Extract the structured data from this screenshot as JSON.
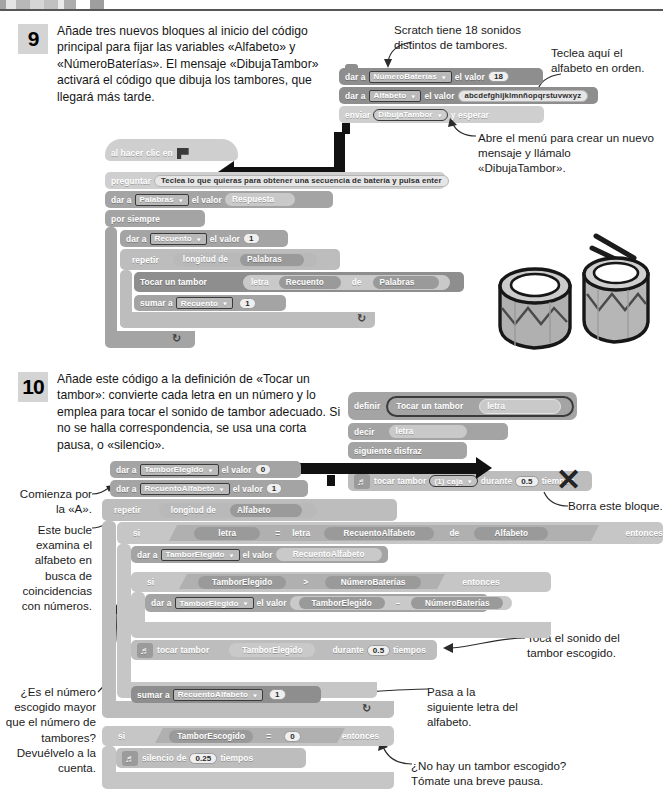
{
  "page": {
    "background": "#ffffff",
    "block_colors": {
      "dark_gray": "#8e8e8e",
      "mid_gray": "#a4a4a4",
      "light_gray": "#bdbdbd",
      "pale_gray": "#cfcfcf",
      "arrow_black": "#111111"
    }
  },
  "step9": {
    "number": "9",
    "text": "Añade tres nuevos bloques al inicio del código principal para fijar las variables «Alfabeto» y «NúmeroBaterías». El mensaje «DibujaTambor» activará el código que dibuja los tambores, que llegará más tarde.",
    "annotations": {
      "scratch_sounds": "Scratch tiene 18 sonidos distintos de tambores.",
      "type_alphabet": "Teclea aquí el alfabeto en orden.",
      "open_menu": "Abre el menú para crear un nuevo mensaje y llámalo «DibujaTambor»."
    },
    "new_blocks": [
      {
        "label": "dar a",
        "variable": "NúmeroBaterías",
        "value_label": "el valor",
        "value": "18"
      },
      {
        "label": "dar a",
        "variable": "Alfabeto",
        "value_label": "el valor",
        "value": "abcdefghijklmnñopqrstuvwxyz"
      },
      {
        "label": "enviar",
        "message": "DibujaTambor",
        "suffix": "y esperar"
      }
    ],
    "main_script": {
      "hat": "al hacer clic en",
      "ask": {
        "label": "preguntar",
        "prompt": "Teclea lo que quieras para obtener una secuencia de batería y pulsa enter"
      },
      "set_words": {
        "label": "dar a",
        "variable": "Palabras",
        "value_label": "el valor",
        "value": "Respuesta"
      },
      "forever": "por siempre",
      "set_count": {
        "label": "dar a",
        "variable": "Recuento",
        "value_label": "el valor",
        "value": "1"
      },
      "repeat": {
        "label": "repetir",
        "operator": "longitud de",
        "operand": "Palabras"
      },
      "play_drum": {
        "label": "Tocar un tambor",
        "letter": "letra",
        "index": "Recuento",
        "of": "de",
        "source": "Palabras"
      },
      "change_count": {
        "label": "sumar a",
        "variable": "Recuento",
        "value": "1"
      }
    }
  },
  "step10": {
    "number": "10",
    "text": "Añade este código a la definición de «Tocar un tambor»: convierte cada letra en un número y lo emplea para tocar el sonido de tambor adecuado. Si no se halla correspondencia, se usa una corta pausa, o «silencio».",
    "annotations": {
      "starts_with_a": "Comienza por la «A».",
      "loop_examines": "Este bucle examina el alfabeto en busca de coincidencias con números.",
      "is_number_bigger": "¿Es el número escogido mayor que el número de tambores? Devuélvelo a la cuenta.",
      "delete_block": "Borra este bloque.",
      "play_sound": "Toca el sonido del tambor escogido.",
      "next_letter": "Pasa a la siguiente letra del alfabeto.",
      "no_drum": "¿No hay un tambor escogido? Tómate una breve pausa."
    },
    "definition": {
      "define_label": "definir",
      "name": "Tocar un tambor",
      "param": "letra",
      "say": {
        "label": "decir",
        "value": "letra"
      },
      "next_costume": "siguiente disfraz",
      "old_play": {
        "label": "tocar tambor",
        "drum": "(1) caja",
        "during_label": "durante",
        "beats": "0.5",
        "beats_label": "tiempos"
      }
    },
    "script": {
      "set_chosen": {
        "label": "dar a",
        "variable": "TamborElegido",
        "value_label": "el valor",
        "value": "0"
      },
      "set_alpha_count": {
        "label": "dar a",
        "variable": "RecuentoAlfabeto",
        "value_label": "el valor",
        "value": "1"
      },
      "repeat": {
        "label": "repetir",
        "operator": "longitud de",
        "operand": "Alfabeto"
      },
      "if_letter": {
        "label": "si",
        "left": "letra",
        "op": "=",
        "right_fn": "letra",
        "right_index": "RecuentoAlfabeto",
        "right_of": "de",
        "right_source": "Alfabeto",
        "then": "entonces"
      },
      "set_chosen_to_count": {
        "label": "dar a",
        "variable": "TamborElegido",
        "value_label": "el valor",
        "value": "RecuentoAlfabeto"
      },
      "if_greater": {
        "label": "si",
        "left": "TamborElegido",
        "op": ">",
        "right": "NúmeroBaterías",
        "then": "entonces"
      },
      "set_wrap": {
        "label": "dar a",
        "variable": "TamborElegido",
        "value_label": "el valor",
        "left": "TamborElegido",
        "op": "–",
        "right": "NúmeroBaterías"
      },
      "play_drum": {
        "label": "tocar tambor",
        "drum": "TamborElegido",
        "during_label": "durante",
        "beats": "0.5",
        "beats_label": "tiempos"
      },
      "change_alpha": {
        "label": "sumar a",
        "variable": "RecuentoAlfabeto",
        "value": "1"
      },
      "if_zero": {
        "label": "si",
        "left": "TamborEscogido",
        "op": "=",
        "right": "0",
        "then": "entonces"
      },
      "rest": {
        "label": "silencio de",
        "beats": "0.25",
        "beats_label": "tiempos"
      }
    }
  },
  "icons": {
    "green_flag": "green-flag-icon",
    "dropdown_caret": "▼",
    "music_note": "♬",
    "loop_arrow": "↻",
    "x_mark": "✕"
  }
}
